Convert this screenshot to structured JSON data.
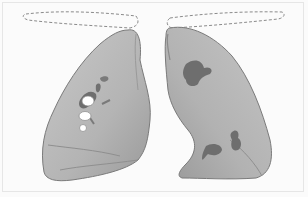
{
  "figure": {
    "colors": {
      "background": "#fbfbfb",
      "lung_fill": "#b9b9b9",
      "lung_shade": "#9e9e9e",
      "lung_edge": "#7a7a7a",
      "lesion": "#6e6e6e",
      "outline_dashed": "#8a8a8a",
      "hilar_node": "#ffffff"
    },
    "parts": {
      "right_lung": {
        "lesions": 3,
        "white_nodes": 3
      },
      "left_lung": {
        "lesions": 3
      },
      "trachea_outlines": 2
    }
  }
}
